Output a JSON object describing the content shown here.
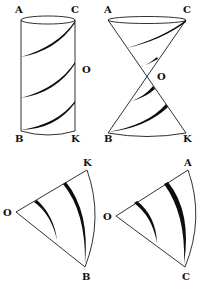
{
  "figures": {
    "cylinder": {
      "labels": {
        "top_left": "A",
        "top_right": "C",
        "center": "O",
        "bottom_left": "B",
        "bottom_right": "K"
      }
    },
    "double_cone": {
      "labels": {
        "top_left": "A",
        "top_right": "C",
        "apex": "O",
        "bottom_left": "B",
        "bottom_right": "K"
      }
    },
    "sector_left": {
      "labels": {
        "apex": "O",
        "top": "K",
        "bottom": "B"
      }
    },
    "sector_right": {
      "labels": {
        "apex": "O",
        "top": "A",
        "bottom": "C"
      }
    }
  },
  "colors": {
    "ink": "#111111",
    "background": "#ffffff"
  }
}
